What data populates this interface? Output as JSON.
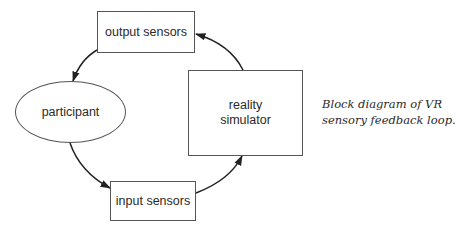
{
  "diagram": {
    "type": "feedback-loop",
    "nodes": {
      "output_sensors": {
        "label": "output sensors",
        "shape": "rectangle"
      },
      "participant": {
        "label": "participant",
        "shape": "ellipse"
      },
      "input_sensors": {
        "label": "input sensors",
        "shape": "rectangle"
      },
      "reality_simulator": {
        "label_line1": "reality",
        "label_line2": "simulator",
        "shape": "rectangle"
      }
    },
    "edges": [
      {
        "from": "output sensors",
        "to": "participant"
      },
      {
        "from": "participant",
        "to": "input sensors"
      },
      {
        "from": "input sensors",
        "to": "reality simulator"
      },
      {
        "from": "reality simulator",
        "to": "output sensors"
      }
    ],
    "caption": {
      "line1": "Block diagram of VR",
      "line2": "sensory feedback loop."
    },
    "colors": {
      "stroke": "#555555",
      "text": "#2a2a2a",
      "background": "#ffffff"
    }
  }
}
